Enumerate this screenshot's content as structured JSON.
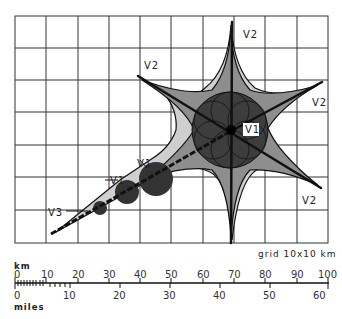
{
  "diagram": {
    "type": "settlement-hierarchy-map",
    "grid_note": "grid 10x10 km",
    "grid": {
      "columns": 10,
      "rows": 7,
      "cell_km": 10
    },
    "labels": {
      "v2_top": "V2",
      "v2_upper_left": "V2",
      "v2_upper_right": "V2",
      "v2_lower_right": "V2",
      "v1_center": "V1",
      "v1_mid": "V1",
      "v1_small": "V1",
      "v3": "V3"
    },
    "colors": {
      "grid": "#333333",
      "light_fill": "#c8c8c8",
      "mid_fill": "#8a8a8a",
      "dark_fill": "#3a3a3a",
      "lines": "#111111"
    }
  },
  "scale": {
    "km_label": "km",
    "miles_label": "miles",
    "km_ticks": [
      "0",
      "10",
      "20",
      "30",
      "40",
      "50",
      "60",
      "70",
      "80",
      "90",
      "100"
    ],
    "mile_ticks": [
      "0",
      "10",
      "20",
      "30",
      "40",
      "50",
      "60"
    ]
  }
}
